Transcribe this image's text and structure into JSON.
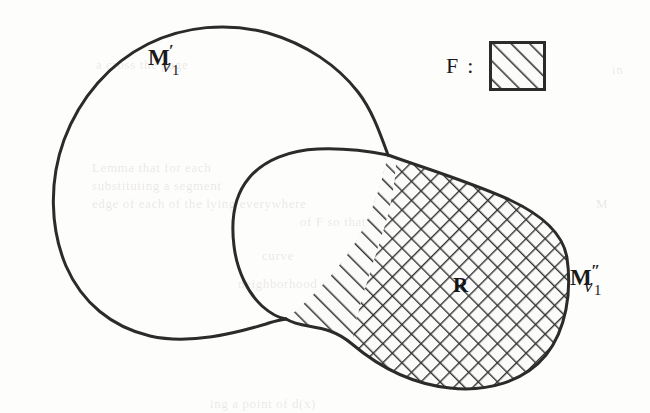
{
  "figure": {
    "caption_labels": {
      "outer_region": {
        "base": "M",
        "prime": "′",
        "sub_var": "v",
        "sub_num": "1"
      },
      "right_region": {
        "base": "M",
        "prime": "″",
        "sub_var": "v",
        "sub_num": "1"
      },
      "hatched_region": "R"
    },
    "legend": {
      "label": "F :",
      "swatch_name": "hatched-square",
      "swatch_pattern": "diagonal-hatch"
    },
    "colors": {
      "ink": "#2b2b2b",
      "paper": "#fdfdfc",
      "hatch": "#333333"
    },
    "ghost_text": [
      {
        "text": "a  cross  the  page",
        "x": 96,
        "y": 57
      },
      {
        "text": "in",
        "x": 612,
        "y": 62
      },
      {
        "text": "Lemma  that  for  each",
        "x": 92,
        "y": 160
      },
      {
        "text": "substituting  a  segment",
        "x": 92,
        "y": 178
      },
      {
        "text": "edge  of  each  of  the  lying  everywhere",
        "x": 92,
        "y": 196
      },
      {
        "text": "of  F  so  that",
        "x": 300,
        "y": 214
      },
      {
        "text": "curve",
        "x": 262,
        "y": 248
      },
      {
        "text": "neighborhood",
        "x": 238,
        "y": 276
      },
      {
        "text": "M",
        "x": 596,
        "y": 196
      },
      {
        "text": "ing  a  point  of  d(x)",
        "x": 210,
        "y": 396
      }
    ]
  }
}
